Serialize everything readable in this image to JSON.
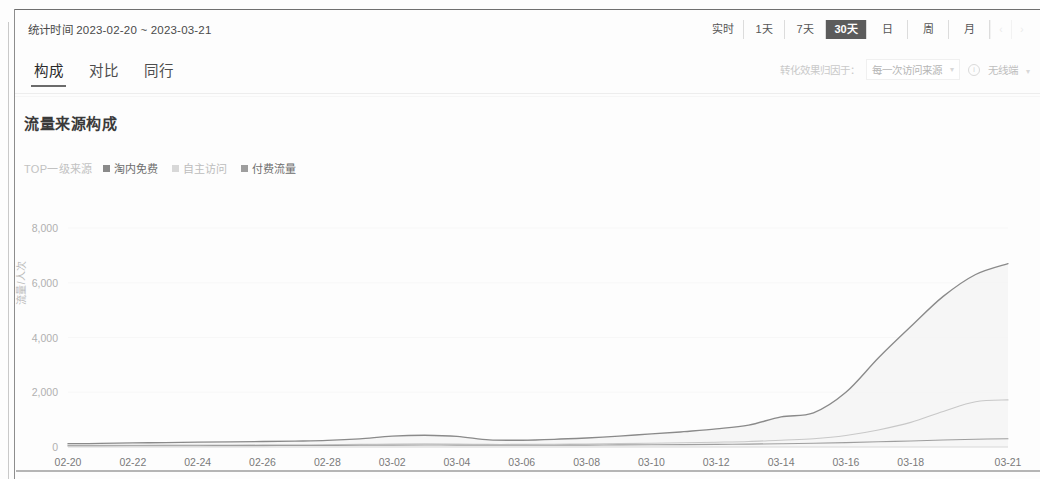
{
  "header": {
    "stat_time_label": "统计时间 2023-02-20 ~ 2023-03-21",
    "range_buttons": [
      {
        "label": "实时",
        "active": false
      },
      {
        "label": "1天",
        "active": false
      },
      {
        "label": "7天",
        "active": false
      },
      {
        "label": "30天",
        "active": true
      },
      {
        "label": "日",
        "active": false
      },
      {
        "label": "周",
        "active": false
      },
      {
        "label": "月",
        "active": false
      }
    ],
    "prev_label": "‹",
    "next_label": "›"
  },
  "tabs": [
    {
      "label": "构成",
      "active": true
    },
    {
      "label": "对比",
      "active": false
    },
    {
      "label": "同行",
      "active": false
    }
  ],
  "attribution": {
    "label": "转化效果归因于：",
    "select_value": "每一次访问来源",
    "chevron": "▾",
    "info_icon": "i",
    "terminal_value": "无线端",
    "terminal_chevron": "▾"
  },
  "section": {
    "title": "流量来源构成"
  },
  "legend": {
    "title": "TOP一级来源",
    "items": [
      {
        "label": "淘内免费",
        "color": "#8a8a8a",
        "muted": false
      },
      {
        "label": "自主访问",
        "color": "#d2d2d2",
        "muted": true
      },
      {
        "label": "付费流量",
        "color": "#9e9e9e",
        "muted": false
      }
    ]
  },
  "chart_data": {
    "type": "area",
    "title": "流量来源构成",
    "xlabel": "",
    "ylabel": "流量/人次",
    "ylim": [
      0,
      8000
    ],
    "yticks": [
      0,
      2000,
      4000,
      6000,
      8000
    ],
    "ytick_labels": [
      "0",
      "2,000",
      "4,000",
      "6,000",
      "8,000"
    ],
    "grid": true,
    "legend_position": "top-left",
    "x": [
      "02-20",
      "02-21",
      "02-22",
      "02-23",
      "02-24",
      "02-25",
      "02-26",
      "02-27",
      "02-28",
      "03-01",
      "03-02",
      "03-03",
      "03-04",
      "03-05",
      "03-06",
      "03-07",
      "03-08",
      "03-09",
      "03-10",
      "03-11",
      "03-12",
      "03-13",
      "03-14",
      "03-15",
      "03-16",
      "03-17",
      "03-18",
      "03-19",
      "03-20",
      "03-21"
    ],
    "xtick_labels": [
      "02-20",
      "02-22",
      "02-24",
      "02-26",
      "02-28",
      "03-02",
      "03-04",
      "03-06",
      "03-08",
      "03-10",
      "03-12",
      "03-14",
      "03-16",
      "03-18",
      "03-21"
    ],
    "series": [
      {
        "name": "淘内免费",
        "color": "#8a8a8a",
        "fill": "#f4f4f4",
        "values": [
          120,
          130,
          150,
          160,
          175,
          185,
          200,
          215,
          240,
          300,
          400,
          430,
          390,
          260,
          250,
          280,
          330,
          400,
          480,
          560,
          660,
          800,
          1100,
          1250,
          2000,
          3250,
          4400,
          5500,
          6300,
          6700
        ]
      },
      {
        "name": "自主访问",
        "color": "#c8c8c8",
        "fill": "none",
        "values": [
          60,
          62,
          65,
          68,
          70,
          72,
          75,
          78,
          82,
          95,
          110,
          118,
          108,
          95,
          96,
          100,
          110,
          125,
          140,
          155,
          175,
          200,
          250,
          300,
          420,
          620,
          900,
          1300,
          1650,
          1720
        ]
      },
      {
        "name": "付费流量",
        "color": "#9e9e9e",
        "fill": "none",
        "values": [
          40,
          42,
          44,
          46,
          48,
          50,
          52,
          55,
          58,
          62,
          70,
          72,
          68,
          62,
          64,
          66,
          70,
          75,
          80,
          86,
          94,
          105,
          120,
          135,
          160,
          190,
          220,
          255,
          285,
          300
        ]
      }
    ],
    "peak": {
      "series": "淘内免费",
      "x": "03-19",
      "value": 6700
    },
    "final_values": {
      "淘内免费": 4200,
      "自主访问": 1500,
      "付费流量": 300
    }
  }
}
